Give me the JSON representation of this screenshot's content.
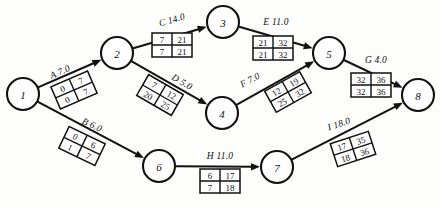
{
  "diagram": {
    "type": "activity-on-arrow-network",
    "colors": {
      "ink": "#111111",
      "paper": "#fdfdfb",
      "cell_fill": "#ffffff"
    },
    "nodes": [
      {
        "id": "1",
        "label": "1",
        "x": 23,
        "y": 94,
        "r": 16
      },
      {
        "id": "2",
        "label": "2",
        "x": 117,
        "y": 53,
        "r": 16
      },
      {
        "id": "3",
        "label": "3",
        "x": 223,
        "y": 22,
        "r": 16
      },
      {
        "id": "4",
        "label": "4",
        "x": 222,
        "y": 113,
        "r": 16
      },
      {
        "id": "5",
        "label": "5",
        "x": 329,
        "y": 53,
        "r": 16
      },
      {
        "id": "6",
        "label": "6",
        "x": 159,
        "y": 166,
        "r": 16
      },
      {
        "id": "7",
        "label": "7",
        "x": 277,
        "y": 167,
        "r": 16
      },
      {
        "id": "8",
        "label": "8",
        "x": 418,
        "y": 95,
        "r": 16
      }
    ],
    "activities": [
      {
        "id": "A",
        "name": "A",
        "duration": "7.0",
        "label": "A 7.0",
        "from": "1",
        "to": "2",
        "label_x": 60,
        "label_y": 72,
        "label_rotate": -23.5,
        "table_x": 74,
        "table_y": 90,
        "table_rotate": -23.5,
        "cells": {
          "es": "0",
          "ef": "7",
          "ls": "0",
          "lf": "7"
        }
      },
      {
        "id": "B",
        "name": "B",
        "duration": "6.0",
        "label": "B 6.0",
        "from": "1",
        "to": "6",
        "label_x": 92,
        "label_y": 125,
        "label_rotate": 25.5,
        "table_x": 82,
        "table_y": 146,
        "table_rotate": 25.5,
        "cells": {
          "es": "0",
          "ef": "6",
          "ls": "1",
          "lf": "7"
        }
      },
      {
        "id": "C",
        "name": "C",
        "duration": "14.0",
        "label": "C 14.0",
        "from": "2",
        "to": "3",
        "label_x": 172,
        "label_y": 20,
        "label_rotate": -16.0,
        "table_x": 172,
        "table_y": 45,
        "table_rotate": 0,
        "cells": {
          "es": "7",
          "ef": "21",
          "ls": "7",
          "lf": "21"
        }
      },
      {
        "id": "D",
        "name": "D",
        "duration": "5.0",
        "label": "D 5.0",
        "from": "2",
        "to": "4",
        "label_x": 182,
        "label_y": 82,
        "label_rotate": 30.0,
        "table_x": 160,
        "table_y": 95,
        "table_rotate": 30.0,
        "cells": {
          "es": "7",
          "ef": "12",
          "ls": "20",
          "lf": "25"
        }
      },
      {
        "id": "E",
        "name": "E",
        "duration": "11.0",
        "label": "E 11.0",
        "from": "3",
        "to": "5",
        "label_x": 276,
        "label_y": 22,
        "label_rotate": 0,
        "table_x": 273,
        "table_y": 48,
        "table_rotate": 0,
        "cells": {
          "es": "21",
          "ef": "32",
          "ls": "21",
          "lf": "32"
        }
      },
      {
        "id": "F",
        "name": "F",
        "duration": "7.0",
        "label": "F 7.0",
        "from": "4",
        "to": "5",
        "label_x": 250,
        "label_y": 80,
        "label_rotate": -29.0,
        "table_x": 288,
        "table_y": 92,
        "table_rotate": -29.0,
        "cells": {
          "es": "12",
          "ef": "19",
          "ls": "25",
          "lf": "32"
        }
      },
      {
        "id": "G",
        "name": "G",
        "duration": "4.0",
        "label": "G 4.0",
        "from": "5",
        "to": "8",
        "label_x": 376,
        "label_y": 60,
        "label_rotate": 0,
        "table_x": 371,
        "table_y": 85,
        "table_rotate": 0,
        "cells": {
          "es": "32",
          "ef": "36",
          "ls": "32",
          "lf": "36"
        }
      },
      {
        "id": "H",
        "name": "H",
        "duration": "11.0",
        "label": "H 11.0",
        "from": "6",
        "to": "7",
        "label_x": 220,
        "label_y": 156,
        "label_rotate": 0,
        "table_x": 220,
        "table_y": 181,
        "table_rotate": 0,
        "cells": {
          "es": "6",
          "ef": "17",
          "ls": "7",
          "lf": "18"
        }
      },
      {
        "id": "I",
        "name": "I",
        "duration": "18.0",
        "label": "I 18.0",
        "from": "7",
        "to": "8",
        "label_x": 339,
        "label_y": 124,
        "label_rotate": -18.0,
        "table_x": 353,
        "table_y": 149,
        "table_rotate": -18.0,
        "cells": {
          "es": "17",
          "ef": "35",
          "ls": "18",
          "lf": "36"
        }
      }
    ]
  }
}
